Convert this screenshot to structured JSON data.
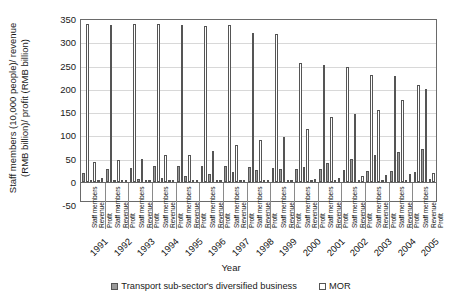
{
  "chart_data": {
    "type": "bar",
    "title": "",
    "xlabel": "Year",
    "ylabel": "Staff members (10,000 people)/ revenue (RMB billion)/ profit (RMB billion)",
    "ylabel_line1": "Staff members (10,000 people)/ revenue",
    "ylabel_line2": "(RMB billion)/ profit (RMB billion)",
    "ylim": [
      -50,
      350
    ],
    "yticks": [
      350,
      300,
      250,
      200,
      150,
      100,
      50,
      0,
      -50
    ],
    "grid": true,
    "legend_position": "bottom",
    "categories": [
      "1991",
      "1992",
      "1993",
      "1994",
      "1995",
      "1996",
      "1997",
      "1998",
      "1999",
      "2000",
      "2001",
      "2002",
      "2003",
      "2004",
      "2005"
    ],
    "subcategories": [
      "Staff members",
      "Revenue",
      "Profit"
    ],
    "series": [
      {
        "name": "Transport sub-sector's diversified business",
        "color": "#9a9a9a",
        "measures": {
          "Staff members": [
            19,
            27,
            31,
            34,
            35,
            35,
            34,
            32,
            31,
            29,
            27,
            26,
            24,
            23,
            22
          ],
          "Revenue": [
            2,
            5,
            6,
            9,
            13,
            17,
            21,
            25,
            28,
            33,
            41,
            49,
            57,
            64,
            71
          ],
          "Profit": [
            0.5,
            1,
            1.2,
            1.5,
            1.8,
            2,
            2.2,
            2.5,
            2.8,
            3,
            3.5,
            4,
            4.5,
            5,
            5.5
          ]
        }
      },
      {
        "name": "MOR",
        "color": "#ffffff",
        "measures": {
          "Staff members": [
            339,
            338,
            340,
            339,
            338,
            336,
            337,
            320,
            318,
            255,
            252,
            248,
            230,
            228,
            208
          ],
          "Revenue": [
            43,
            47,
            49,
            57,
            57,
            66,
            80,
            90,
            97,
            113,
            139,
            145,
            155,
            177,
            199
          ],
          "Profit": [
            8,
            5,
            4,
            3,
            2,
            2,
            3,
            4,
            5,
            7,
            9,
            12,
            14,
            17,
            20
          ]
        }
      }
    ]
  },
  "legend": {
    "items": [
      {
        "label": "Transport sub-sector's diversified business"
      },
      {
        "label": "MOR"
      }
    ]
  }
}
